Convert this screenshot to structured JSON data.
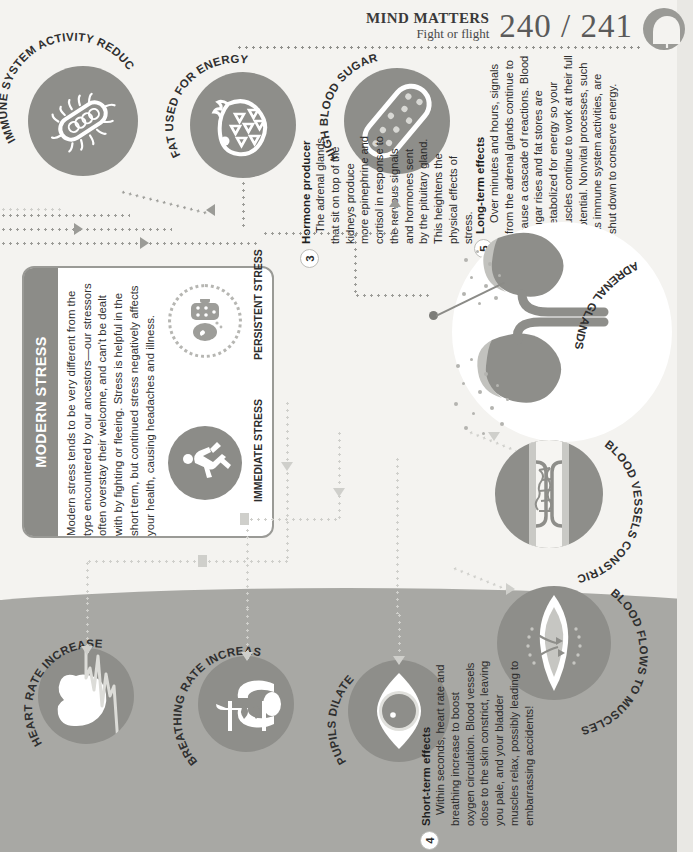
{
  "header": {
    "title": "MIND MATTERS",
    "subtitle": "Fight or flight",
    "page_left": "240",
    "separator": "/",
    "page_right": "241",
    "badge_icon": "head-gears-icon"
  },
  "top_icons": [
    {
      "id": "immune",
      "label": "IMMUNE SYSTEM ACTIVITY REDUCED",
      "icon": "bacteria-icon"
    },
    {
      "id": "fat",
      "label": "FAT USED FOR ENERGY",
      "icon": "fat-cell-icon"
    },
    {
      "id": "sugar",
      "label": "HIGH BLOOD SUGAR",
      "icon": "blood-sugar-vessel-icon"
    }
  ],
  "right_icons": [
    {
      "id": "adrenal",
      "label": "ADRENAL GLANDS",
      "icon": "kidneys-adrenal-icon"
    },
    {
      "id": "vessels",
      "label": "BLOOD VESSELS CONSTRICT",
      "icon": "constricted-vessel-icon"
    },
    {
      "id": "muscles",
      "label": "BLOOD FLOWS TO MUSCLES",
      "icon": "muscle-icon"
    }
  ],
  "bottom_icons": [
    {
      "id": "heart",
      "label": "HEART RATE INCREASES",
      "icon": "heart-ecg-icon"
    },
    {
      "id": "breathing",
      "label": "BREATHING RATE INCREASES",
      "icon": "lungs-icon"
    },
    {
      "id": "pupils",
      "label": "PUPILS DILATE",
      "icon": "eye-icon"
    }
  ],
  "modern_stress": {
    "title": "MODERN STRESS",
    "body": "Modern stress tends to be very different from the type encountered by our ancestors—our stressors often overstay their welcome, and can't be dealt with by fighting or fleeing. Stress is helpful in the short term, but continued stress negatively affects your health, causing headaches and illness.",
    "immediate_label": "IMMEDIATE STRESS",
    "persistent_label": "PERSISTENT STRESS",
    "immediate_icon": "running-figure-icon",
    "persistent_icon": "desk-worker-icon"
  },
  "blurbs": [
    {
      "id": "hormone-producer",
      "number": "3",
      "heading": "Hormone producer",
      "text": "The adrenal glands that sit on top of the kidneys produce more epinephrine and cortisol in response to the nervous signals and hormones sent by the pituitary gland. This heightens the physical effects of stress."
    },
    {
      "id": "short-term-effects",
      "number": "4",
      "heading": "Short-term effects",
      "text": "Within seconds, heart rate and breathing increase to boost oxygen circulation. Blood vessels close to the skin constrict, leaving you pale, and your bladder muscles relax, possibly leading to embarrassing accidents!"
    },
    {
      "id": "long-term-effects",
      "number": "5",
      "heading": "Long-term effects",
      "text": "Over minutes and hours, signals from the adrenal glands continue to cause a cascade of reactions. Blood sugar rises and fat stores are metabolized for energy so your muscles continue to work at their full potential. Nonvital processes, such as immune system activities, are shut down to conserve energy."
    }
  ],
  "colors": {
    "paper": "#f4f3f0",
    "ground": "#a8a8a4",
    "icon_fill": "#8e8e8a",
    "accent_dark": "#8c8c88",
    "text": "#2c2c2c",
    "connector": "#9b9b97"
  }
}
